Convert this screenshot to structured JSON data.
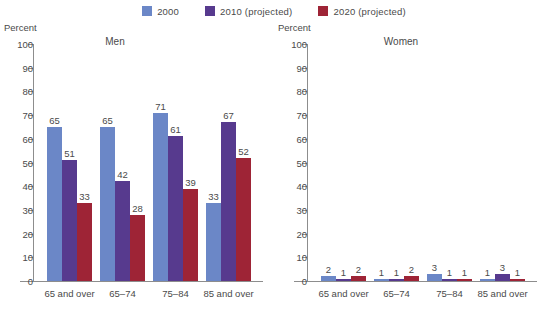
{
  "legend": {
    "entries": [
      {
        "label": "2000",
        "color": "#6b87c7",
        "icon": "legend-swatch-2000"
      },
      {
        "label": "2010 (projected)",
        "color": "#573a8e",
        "icon": "legend-swatch-2010"
      },
      {
        "label": "2020 (projected)",
        "color": "#9e2436",
        "icon": "legend-swatch-2020"
      }
    ]
  },
  "axis": {
    "unit_label": "Percent",
    "ticks": [
      "100",
      "90",
      "80",
      "70",
      "60",
      "50",
      "40",
      "30",
      "20",
      "10",
      "0"
    ]
  },
  "panels": [
    {
      "title": "Men"
    },
    {
      "title": "Women"
    }
  ],
  "chart_data": [
    {
      "type": "bar",
      "title": "Men",
      "xlabel": "",
      "ylabel": "Percent",
      "ylim": [
        0,
        100
      ],
      "yticks": [
        0,
        10,
        20,
        30,
        40,
        50,
        60,
        70,
        80,
        90,
        100
      ],
      "grid": false,
      "legend_position": "top-center",
      "categories": [
        "65 and over",
        "65–74",
        "75–84",
        "85 and over"
      ],
      "series": [
        {
          "name": "2000",
          "color": "#6b87c7",
          "values": [
            65,
            65,
            71,
            33
          ]
        },
        {
          "name": "2010 (projected)",
          "color": "#573a8e",
          "values": [
            51,
            42,
            61,
            67
          ]
        },
        {
          "name": "2020 (projected)",
          "color": "#9e2436",
          "values": [
            33,
            28,
            39,
            52
          ]
        }
      ]
    },
    {
      "type": "bar",
      "title": "Women",
      "xlabel": "",
      "ylabel": "Percent",
      "ylim": [
        0,
        100
      ],
      "yticks": [
        0,
        10,
        20,
        30,
        40,
        50,
        60,
        70,
        80,
        90,
        100
      ],
      "grid": false,
      "legend_position": "top-center",
      "categories": [
        "65 and over",
        "65–74",
        "75–84",
        "85 and over"
      ],
      "series": [
        {
          "name": "2000",
          "color": "#6b87c7",
          "values": [
            2,
            1,
            3,
            1
          ]
        },
        {
          "name": "2010 (projected)",
          "color": "#573a8e",
          "values": [
            1,
            1,
            1,
            3
          ]
        },
        {
          "name": "2020 (projected)",
          "color": "#9e2436",
          "values": [
            2,
            2,
            1,
            1
          ]
        }
      ]
    }
  ]
}
